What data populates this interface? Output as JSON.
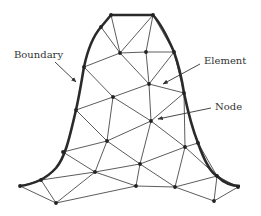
{
  "figure": {
    "type": "finite-element-mesh",
    "colors": {
      "boundary": "#2a2a2a",
      "edge": "#4a4a4a",
      "node": "#222222",
      "text": "#333333",
      "background": "#ffffff"
    },
    "labels": [
      {
        "id": "boundary",
        "text": "Boundary",
        "x": 14,
        "y": 50,
        "arrow_from": [
          55,
          62
        ],
        "arrow_to": [
          76,
          82
        ]
      },
      {
        "id": "element",
        "text": "Element",
        "x": 204,
        "y": 56,
        "arrow_from": [
          200,
          64
        ],
        "arrow_to": [
          163,
          84
        ]
      },
      {
        "id": "node",
        "text": "Node",
        "x": 215,
        "y": 102,
        "arrow_from": [
          211,
          108
        ],
        "arrow_to": [
          158,
          119
        ]
      }
    ]
  },
  "mesh": {
    "boundary_path": "M20,186 C35,184 47,178 56,168 C66,156 70,135 76,110 C80,92 82,78 84,67 C88,48 94,35 101,27 L111,15 L153,15 C162,25 168,38 174,52 C179,66 182,80 184,93 C188,112 192,128 198,143 C204,160 210,172 217,176 C224,183 232,186 240,186",
    "nodes": [
      [
        111,
        15
      ],
      [
        153,
        15
      ],
      [
        101,
        27
      ],
      [
        84,
        67
      ],
      [
        76,
        110
      ],
      [
        63,
        152
      ],
      [
        41,
        180
      ],
      [
        20,
        186
      ],
      [
        174,
        52
      ],
      [
        184,
        93
      ],
      [
        198,
        143
      ],
      [
        217,
        176
      ],
      [
        238,
        187
      ],
      [
        120,
        53
      ],
      [
        146,
        52
      ],
      [
        149,
        84
      ],
      [
        113,
        97
      ],
      [
        151,
        121
      ],
      [
        107,
        141
      ],
      [
        95,
        172
      ],
      [
        140,
        164
      ],
      [
        185,
        147
      ],
      [
        136,
        186
      ],
      [
        175,
        187
      ],
      [
        56,
        203
      ],
      [
        214,
        201
      ]
    ],
    "edges": [
      [
        0,
        13
      ],
      [
        2,
        13
      ],
      [
        1,
        13
      ],
      [
        1,
        14
      ],
      [
        1,
        8
      ],
      [
        13,
        14
      ],
      [
        14,
        8
      ],
      [
        3,
        13
      ],
      [
        13,
        15
      ],
      [
        14,
        15
      ],
      [
        8,
        15
      ],
      [
        3,
        16
      ],
      [
        15,
        16
      ],
      [
        15,
        9
      ],
      [
        8,
        9
      ],
      [
        4,
        16
      ],
      [
        16,
        17
      ],
      [
        15,
        17
      ],
      [
        9,
        17
      ],
      [
        4,
        18
      ],
      [
        18,
        16
      ],
      [
        18,
        17
      ],
      [
        17,
        21
      ],
      [
        9,
        21
      ],
      [
        10,
        21
      ],
      [
        5,
        18
      ],
      [
        18,
        19
      ],
      [
        5,
        19
      ],
      [
        18,
        20
      ],
      [
        17,
        20
      ],
      [
        20,
        21
      ],
      [
        19,
        20
      ],
      [
        6,
        19
      ],
      [
        7,
        6
      ],
      [
        19,
        24
      ],
      [
        6,
        24
      ],
      [
        7,
        24
      ],
      [
        24,
        22
      ],
      [
        19,
        22
      ],
      [
        20,
        22
      ],
      [
        22,
        23
      ],
      [
        20,
        23
      ],
      [
        21,
        23
      ],
      [
        23,
        11
      ],
      [
        21,
        11
      ],
      [
        10,
        11
      ],
      [
        11,
        25
      ],
      [
        23,
        25
      ],
      [
        25,
        12
      ],
      [
        11,
        12
      ]
    ]
  }
}
